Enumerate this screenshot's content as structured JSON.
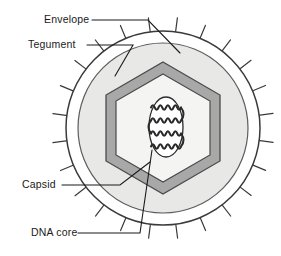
{
  "diagram": {
    "type": "labelled-cross-section",
    "background_color": "#ffffff",
    "labels": [
      {
        "id": "envelope",
        "text": "Envelope",
        "text_x": 44,
        "text_y": 23,
        "leader": "from label to outer envelope membrane"
      },
      {
        "id": "tegument",
        "text": "Tegument",
        "text_x": 28,
        "text_y": 48,
        "leader": "from label to tegument layer"
      },
      {
        "id": "capsid",
        "text": "Capsid",
        "text_x": 22,
        "text_y": 188,
        "leader": "from label to hexagonal capsid wall"
      },
      {
        "id": "dna-core",
        "text": "DNA core",
        "text_x": 31,
        "text_y": 236,
        "leader": "from label to central DNA core"
      }
    ],
    "structures": {
      "envelope": {
        "name": "envelope",
        "shape": "circle",
        "cx": 163,
        "cy": 128,
        "r": 97,
        "fill": "#ffffff",
        "stroke": "#3a3a3a",
        "stroke_width": 1.4,
        "spike_count": 24,
        "spike_length": 14,
        "spike_color": "#3a3a3a"
      },
      "tegument": {
        "name": "tegument",
        "shape": "circle",
        "cx": 163,
        "cy": 128,
        "r": 85,
        "fill": "#e8e8e6",
        "stroke": "#5a5a5a",
        "stroke_width": 1.2
      },
      "capsid": {
        "name": "capsid",
        "shape": "hexagon-ring",
        "cx": 163,
        "cy": 128,
        "outer_radius": 66,
        "wall_thickness": 7,
        "fill": "#a8a8a8",
        "stroke": "#4a4a4a",
        "stroke_width": 1.2,
        "interior_fill": "#f4f4f2"
      },
      "dna_core": {
        "name": "dna-core",
        "shape": "oval-with-coiled-dna",
        "cx": 166,
        "cy": 127,
        "rx": 17,
        "ry": 30,
        "fill": "#ffffff",
        "stroke": "#2a2a2a",
        "stroke_width": 1.3,
        "strand_count": 4,
        "strand_color": "#2a2a2a"
      }
    },
    "colors": {
      "ink": "#1a1a1a",
      "outline": "#3a3a3a",
      "tegument_fill": "#e8e8e6",
      "capsid_wall": "#a8a8a8",
      "capsid_interior": "#f4f4f2",
      "page_background": "#ffffff"
    }
  }
}
